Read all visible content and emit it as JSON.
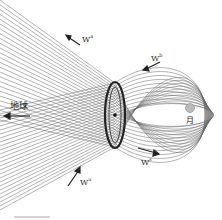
{
  "diagram": {
    "labels": {
      "earth": "地球",
      "moon": "月"
    },
    "w_labels": [
      {
        "id": "top-left",
        "base": "W",
        "sup": "a"
      },
      {
        "id": "top-right",
        "base": "W",
        "sup": "b"
      },
      {
        "id": "bottom-right",
        "base": "W",
        "sup": "s"
      },
      {
        "id": "bottom-left",
        "base": "W",
        "sup": "u"
      }
    ],
    "colors": {
      "lines": "#555555",
      "dense": "#222222",
      "background": "#ffffff"
    }
  }
}
